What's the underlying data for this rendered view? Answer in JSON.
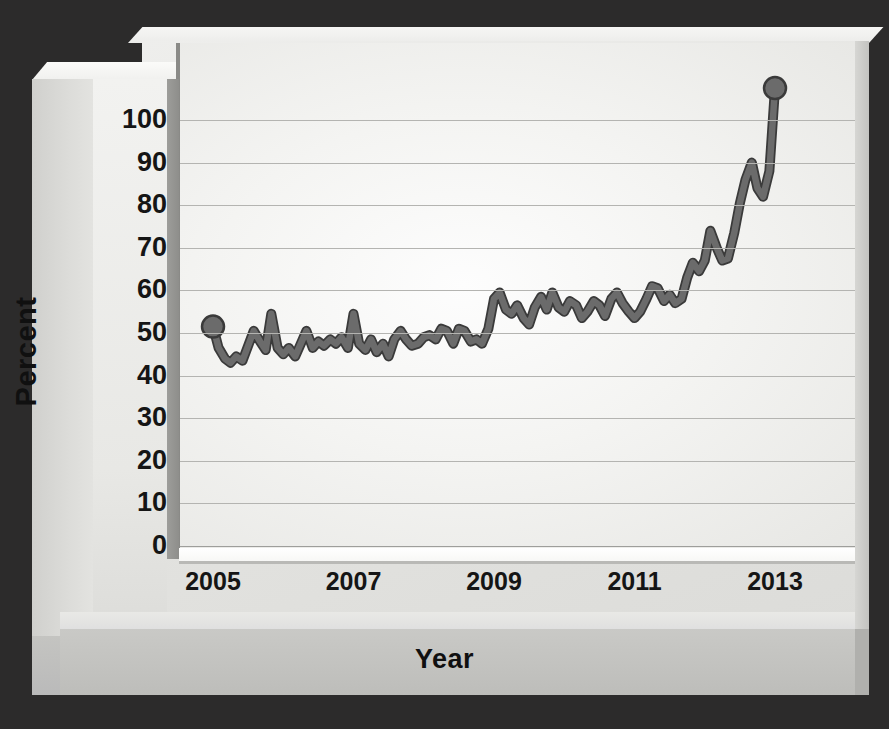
{
  "chart_data": {
    "type": "line",
    "title": "",
    "xlabel": "Year",
    "ylabel": "Percent",
    "xlim": [
      2004.85,
      2013.1
    ],
    "ylim": [
      0,
      108
    ],
    "grid": true,
    "legend": false,
    "line_color": "#6b6b6b",
    "line_outline_color": "#3a3a3a",
    "marker_color": "#6b6b6b",
    "x_ticks": [
      2005,
      2007,
      2009,
      2011,
      2013
    ],
    "x_tick_labels": [
      "2005",
      "2007",
      "2009",
      "2011",
      "2013"
    ],
    "y_ticks": [
      0,
      10,
      20,
      30,
      40,
      50,
      60,
      70,
      80,
      90,
      100
    ],
    "y_tick_labels": [
      "0",
      "10",
      "20",
      "30",
      "40",
      "50",
      "60",
      "70",
      "80",
      "90",
      "100"
    ],
    "endpoint_markers": [
      {
        "x": 2005.0,
        "y": 51.5,
        "label": "start"
      },
      {
        "x": 2013.0,
        "y": 107.5,
        "label": "end"
      }
    ],
    "series": [
      {
        "name": "Percent",
        "x": [
          2005.0,
          2005.08,
          2005.17,
          2005.25,
          2005.33,
          2005.42,
          2005.5,
          2005.58,
          2005.67,
          2005.75,
          2005.83,
          2005.92,
          2006.0,
          2006.08,
          2006.17,
          2006.25,
          2006.33,
          2006.42,
          2006.5,
          2006.58,
          2006.67,
          2006.75,
          2006.83,
          2006.92,
          2007.0,
          2007.08,
          2007.17,
          2007.25,
          2007.33,
          2007.42,
          2007.5,
          2007.58,
          2007.67,
          2007.75,
          2007.83,
          2007.92,
          2008.0,
          2008.08,
          2008.17,
          2008.25,
          2008.33,
          2008.42,
          2008.5,
          2008.58,
          2008.67,
          2008.75,
          2008.83,
          2008.92,
          2009.0,
          2009.08,
          2009.17,
          2009.25,
          2009.33,
          2009.42,
          2009.5,
          2009.58,
          2009.67,
          2009.75,
          2009.83,
          2009.92,
          2010.0,
          2010.08,
          2010.17,
          2010.25,
          2010.33,
          2010.42,
          2010.5,
          2010.58,
          2010.67,
          2010.75,
          2010.83,
          2010.92,
          2011.0,
          2011.08,
          2011.17,
          2011.25,
          2011.33,
          2011.42,
          2011.5,
          2011.58,
          2011.67,
          2011.75,
          2011.83,
          2011.92,
          2012.0,
          2012.08,
          2012.17,
          2012.25,
          2012.33,
          2012.42,
          2012.5,
          2012.58,
          2012.67,
          2012.75,
          2012.83,
          2012.92,
          2013.0
        ],
        "values": [
          51.5,
          46.5,
          44.0,
          43.0,
          44.5,
          43.5,
          47.0,
          50.5,
          48.0,
          46.0,
          54.5,
          46.5,
          45.0,
          46.5,
          44.5,
          47.5,
          50.5,
          46.5,
          48.0,
          47.0,
          48.5,
          47.5,
          49.0,
          46.5,
          54.5,
          47.5,
          46.0,
          48.5,
          45.5,
          47.5,
          44.5,
          48.5,
          50.5,
          48.5,
          47.0,
          47.5,
          49.0,
          49.5,
          48.5,
          51.0,
          50.5,
          47.5,
          51.0,
          50.5,
          48.0,
          48.5,
          47.5,
          51.0,
          58.0,
          59.5,
          55.5,
          54.5,
          56.5,
          53.5,
          52.0,
          56.0,
          58.5,
          55.5,
          59.5,
          56.0,
          55.0,
          57.5,
          56.5,
          53.5,
          55.0,
          57.5,
          56.5,
          54.0,
          58.0,
          59.5,
          57.0,
          55.0,
          53.5,
          55.0,
          58.0,
          61.0,
          60.5,
          57.5,
          59.0,
          57.0,
          58.0,
          63.0,
          66.5,
          64.5,
          67.0,
          74.0,
          70.0,
          67.0,
          67.5,
          73.5,
          80.5,
          86.0,
          90.0,
          84.0,
          82.0,
          88.0,
          107.5
        ]
      }
    ],
    "series_tail": {
      "note": "continuation beyond 2012.92 to endpoint",
      "x": [
        2012.92,
        2013.0
      ],
      "values": [
        88.0,
        107.5
      ]
    }
  },
  "axes": {
    "y_axis_title": "Percent",
    "x_axis_title": "Year"
  },
  "style": {
    "background_color": "#2c2b2b",
    "panel_color": "#f4f4f2",
    "frame_color": "#e4e4e1",
    "grid_color": "#b4b4b1",
    "text_color": "#151515",
    "line_color": "#6b6b6b"
  }
}
